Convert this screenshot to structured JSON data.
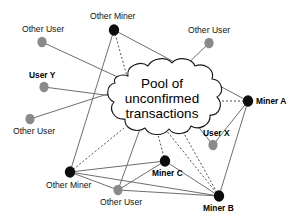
{
  "diagram": {
    "cloud": {
      "line1": "Pool of",
      "line2": "unconfirmed",
      "line3": "transactions",
      "fill_color": "#ffffff",
      "stroke_color": "#1a1a1a"
    },
    "colors": {
      "miner_node": "#0d0d0d",
      "user_node": "#8a8a8a",
      "solid_edge": "#6e6e6e",
      "dashed_edge": "#3c3c3c",
      "background": "#ffffff",
      "text": "#111111"
    },
    "nodes": [
      {
        "id": "other-user-topleft",
        "label": "Other User",
        "type": "user",
        "bold": false,
        "cx": 42,
        "cy": 42,
        "r": 4.6,
        "label_x": 22,
        "label_y": 24
      },
      {
        "id": "other-miner-top",
        "label": "Other Miner",
        "type": "miner",
        "bold": false,
        "cx": 114,
        "cy": 30,
        "r": 5.2,
        "label_x": 90,
        "label_y": 11
      },
      {
        "id": "other-user-topright",
        "label": "Other User",
        "type": "user",
        "bold": false,
        "cx": 209,
        "cy": 43,
        "r": 4.6,
        "label_x": 188,
        "label_y": 25
      },
      {
        "id": "user-y",
        "label": "User Y",
        "type": "user",
        "bold": true,
        "cx": 44,
        "cy": 87,
        "r": 4.6,
        "label_x": 29,
        "label_y": 70
      },
      {
        "id": "other-user-left",
        "label": "Other User",
        "type": "user",
        "bold": false,
        "cx": 30,
        "cy": 119,
        "r": 4.6,
        "label_x": 13,
        "label_y": 126
      },
      {
        "id": "miner-a",
        "label": "Miner A",
        "type": "miner",
        "bold": true,
        "cx": 248,
        "cy": 101,
        "r": 5.2,
        "label_x": 256,
        "label_y": 96
      },
      {
        "id": "user-x",
        "label": "User X",
        "type": "user",
        "bold": true,
        "cx": 213,
        "cy": 145,
        "r": 4.6,
        "label_x": 203,
        "label_y": 128
      },
      {
        "id": "miner-c",
        "label": "Miner C",
        "type": "miner",
        "bold": true,
        "cx": 165,
        "cy": 161,
        "r": 5.2,
        "label_x": 152,
        "label_y": 168
      },
      {
        "id": "other-miner-bottom",
        "label": "Other Miner",
        "type": "miner",
        "bold": false,
        "cx": 70,
        "cy": 172,
        "r": 5.2,
        "label_x": 46,
        "label_y": 180
      },
      {
        "id": "other-user-bottom",
        "label": "Other User",
        "type": "user",
        "bold": false,
        "cx": 118,
        "cy": 190,
        "r": 4.6,
        "label_x": 100,
        "label_y": 197
      },
      {
        "id": "miner-b",
        "label": "Miner B",
        "type": "miner",
        "bold": true,
        "cx": 219,
        "cy": 196,
        "r": 5.2,
        "label_x": 203,
        "label_y": 203
      }
    ],
    "edges": [
      {
        "from": "other-user-topleft",
        "to": "cloud-upper-left",
        "style": "solid",
        "x1": 42,
        "y1": 42,
        "x2": 150,
        "y2": 92
      },
      {
        "from": "user-y",
        "to": "cloud-left",
        "style": "solid",
        "x1": 44,
        "y1": 87,
        "x2": 120,
        "y2": 97
      },
      {
        "from": "other-user-left",
        "to": "cloud-lower-left",
        "style": "solid",
        "x1": 30,
        "y1": 119,
        "x2": 126,
        "y2": 88
      },
      {
        "from": "other-user-topright",
        "to": "cloud-top",
        "style": "solid",
        "x1": 209,
        "y1": 43,
        "x2": 175,
        "y2": 76
      },
      {
        "from": "other-miner-top",
        "to": "cloud-top",
        "style": "dashed",
        "x1": 114,
        "y1": 30,
        "x2": 128,
        "y2": 80
      },
      {
        "from": "other-miner-top",
        "to": "miner-a",
        "style": "solid",
        "x1": 114,
        "y1": 30,
        "x2": 248,
        "y2": 101
      },
      {
        "from": "other-miner-top",
        "to": "other-miner-bottom",
        "style": "solid",
        "x1": 114,
        "y1": 30,
        "x2": 70,
        "y2": 172
      },
      {
        "from": "miner-a",
        "to": "cloud-right",
        "style": "dashed",
        "x1": 248,
        "y1": 101,
        "x2": 200,
        "y2": 101
      },
      {
        "from": "miner-a",
        "to": "user-x",
        "style": "solid",
        "x1": 248,
        "y1": 101,
        "x2": 213,
        "y2": 145
      },
      {
        "from": "miner-a",
        "to": "miner-b",
        "style": "solid",
        "x1": 248,
        "y1": 101,
        "x2": 219,
        "y2": 196
      },
      {
        "from": "user-x",
        "to": "cloud-lower-right",
        "style": "solid",
        "x1": 213,
        "y1": 145,
        "x2": 196,
        "y2": 124
      },
      {
        "from": "miner-c",
        "to": "cloud-bottom",
        "style": "dashed",
        "x1": 165,
        "y1": 161,
        "x2": 157,
        "y2": 131
      },
      {
        "from": "miner-c",
        "to": "other-miner-bottom",
        "style": "solid",
        "x1": 165,
        "y1": 161,
        "x2": 70,
        "y2": 172
      },
      {
        "from": "miner-c",
        "to": "miner-b",
        "style": "solid",
        "x1": 165,
        "y1": 161,
        "x2": 219,
        "y2": 196
      },
      {
        "from": "miner-b",
        "to": "cloud-bottom-right",
        "style": "dashed",
        "x1": 219,
        "y1": 196,
        "x2": 182,
        "y2": 130
      },
      {
        "from": "miner-b",
        "to": "cloud-bottom-mid",
        "style": "dashed",
        "x1": 219,
        "y1": 196,
        "x2": 166,
        "y2": 130
      },
      {
        "from": "miner-b",
        "to": "other-miner-bottom",
        "style": "solid",
        "x1": 219,
        "y1": 196,
        "x2": 70,
        "y2": 172
      },
      {
        "from": "other-miner-bottom",
        "to": "cloud-bottom-left",
        "style": "dashed",
        "x1": 70,
        "y1": 172,
        "x2": 124,
        "y2": 128
      },
      {
        "from": "other-miner-bottom",
        "to": "other-user-bottom",
        "style": "solid",
        "x1": 70,
        "y1": 172,
        "x2": 118,
        "y2": 190
      },
      {
        "from": "other-user-bottom",
        "to": "cloud-bottom-left2",
        "style": "solid",
        "x1": 118,
        "y1": 190,
        "x2": 140,
        "y2": 129
      },
      {
        "from": "other-user-bottom",
        "to": "miner-b",
        "style": "solid",
        "x1": 118,
        "y1": 190,
        "x2": 219,
        "y2": 196
      },
      {
        "from": "other-user-bottom",
        "to": "miner-c-left",
        "style": "solid",
        "x1": 118,
        "y1": 190,
        "x2": 165,
        "y2": 161
      }
    ]
  }
}
